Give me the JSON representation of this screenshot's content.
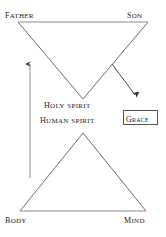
{
  "diagram": {
    "background_color": "#ffffff",
    "line_color": "#6b6b6b",
    "text_color": "#1a1a1a",
    "upper_triangle": {
      "name": "inverted-triangle-divine",
      "vertices": {
        "top_left": "Father",
        "top_right": "Son",
        "apex_bottom": "Holy Spirit"
      }
    },
    "lower_triangle": {
      "name": "upright-triangle-human",
      "vertices": {
        "bottom_left": "Body",
        "bottom_right": "Mind",
        "apex_top": "Human Spirit"
      }
    },
    "labels": {
      "father": "Father",
      "son": "Son",
      "holy_spirit": "Holy Spirit",
      "human_spirit": "Human Spirit",
      "body": "Body",
      "mind": "Mind",
      "grace": "Grace"
    },
    "arrows": [
      {
        "name": "ascent-arrow",
        "direction": "up",
        "from": [
          30,
          178
        ],
        "to": [
          30,
          62
        ]
      },
      {
        "name": "grace-arrow",
        "direction": "down-right",
        "from": [
          112,
          64
        ],
        "to": [
          136,
          97
        ]
      }
    ],
    "grace_box": {
      "label": "Grace",
      "border_color": "#555555"
    }
  }
}
